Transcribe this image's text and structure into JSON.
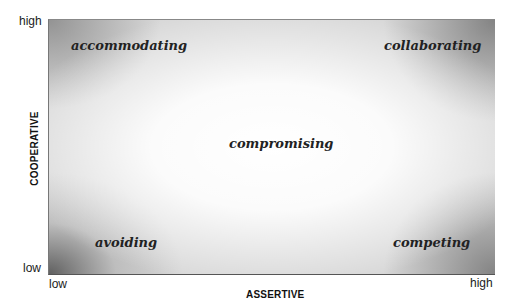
{
  "diagram": {
    "x_axis": {
      "label": "ASSERTIVE",
      "low": "low",
      "high": "high"
    },
    "y_axis": {
      "label": "COOPERATIVE",
      "low": "low",
      "high": "high"
    },
    "quadrants": {
      "top_left": "accommodating",
      "top_right": "collaborating",
      "center": "compromising",
      "bottom_left": "avoiding",
      "bottom_right": "competing"
    }
  }
}
